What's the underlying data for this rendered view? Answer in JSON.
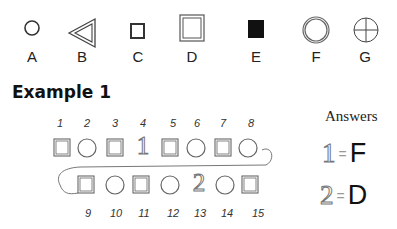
{
  "legend": {
    "items": [
      {
        "label": "A",
        "shape": "circle-thin"
      },
      {
        "label": "B",
        "shape": "triangle-double-left"
      },
      {
        "label": "C",
        "shape": "square-small-thick"
      },
      {
        "label": "D",
        "shape": "square-large-double"
      },
      {
        "label": "E",
        "shape": "square-filled-black"
      },
      {
        "label": "F",
        "shape": "circle-large-double"
      },
      {
        "label": "G",
        "shape": "circle-crosshair"
      }
    ]
  },
  "example": {
    "title": "Example 1",
    "row1_numbers": [
      "1",
      "2",
      "3",
      "4",
      "5",
      "6",
      "7",
      "8"
    ],
    "row1_shapes": [
      "square",
      "circle",
      "square",
      "digit-1",
      "square",
      "circle",
      "square",
      "circle"
    ],
    "row2_numbers": [
      "9",
      "10",
      "11",
      "12",
      "13",
      "14",
      "15"
    ],
    "row2_shapes": [
      "square",
      "circle",
      "square",
      "circle",
      "digit-2",
      "circle",
      "square"
    ],
    "seq_digit_1": "1",
    "seq_digit_2": "2"
  },
  "answers": {
    "title": "Answers",
    "items": [
      {
        "number": "1",
        "equals": "=",
        "letter": "F"
      },
      {
        "number": "2",
        "equals": "=",
        "letter": "D"
      }
    ]
  }
}
